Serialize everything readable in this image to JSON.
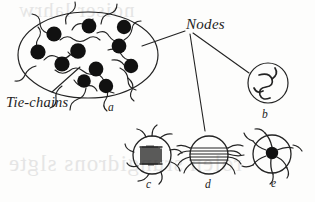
{
  "figure": {
    "kind": "scientific-diagram",
    "background_color": "#fdfdfc",
    "ink_color": "#232323",
    "labels": {
      "nodes": "Nodes",
      "tie_chains": "Tie-chains"
    },
    "panel_letters": {
      "a": "a",
      "b": "b",
      "c": "c",
      "d": "d",
      "e": "e"
    },
    "panels": [
      {
        "letter": "a",
        "description": "Large ellipse containing eleven black filled nodes interconnected by wavy tie-chains",
        "node_count": 11,
        "shape": "ellipse"
      },
      {
        "letter": "b",
        "description": "Open circle enclosing a single coiled chain loop",
        "node_count": 1,
        "shape": "circle"
      },
      {
        "letter": "c",
        "description": "Circle enclosing a dense hatched crystalline block with chains radiating outward",
        "node_count": 1,
        "shape": "circle"
      },
      {
        "letter": "d",
        "description": "Circle crossed by parallel lamellar chain bundles with frayed ends on both sides",
        "node_count": 1,
        "shape": "circle"
      },
      {
        "letter": "e",
        "description": "Circle with a solid black core and chains radiating outward like a pinwheel",
        "node_count": 1,
        "shape": "circle"
      }
    ],
    "leader_lines": [
      {
        "from": "Nodes",
        "to": "a"
      },
      {
        "from": "Nodes",
        "to": "b"
      },
      {
        "from": "Nodes",
        "to": "d"
      },
      {
        "from": "Tie-chains",
        "to": "a"
      }
    ]
  },
  "bleed_through": {
    "top": "noiser lahrw",
    "bottom": "rolen srungidrons slgte"
  }
}
